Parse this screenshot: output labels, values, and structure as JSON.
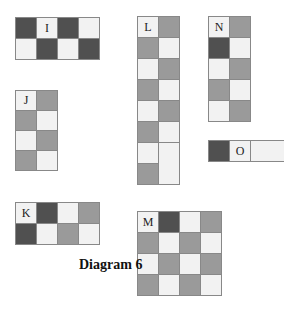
{
  "diagram": {
    "caption": "Diagram 6",
    "colors": {
      "white": "#f2f2f2",
      "gray": "#9a9a9a",
      "dark": "#505050"
    },
    "pieces": [
      {
        "id": "I",
        "label": "I",
        "rows": [
          [
            "w",
            "d",
            "w",
            "d"
          ],
          [
            "w",
            "d",
            "w",
            "d"
          ]
        ]
      },
      {
        "id": "J",
        "label": "J",
        "rows": [
          [
            "w",
            "g"
          ],
          [
            "g",
            "w"
          ],
          [
            "w",
            "g"
          ],
          [
            "g",
            "w"
          ]
        ]
      },
      {
        "id": "K",
        "label": "K",
        "rows": [
          [
            "w",
            "d",
            "w",
            "g"
          ],
          [
            "d",
            "w",
            "g",
            "w"
          ]
        ]
      },
      {
        "id": "L",
        "label": "L",
        "rows": [
          [
            "w",
            "g"
          ],
          [
            "g",
            "w"
          ],
          [
            "w",
            "g"
          ],
          [
            "g",
            "w"
          ],
          [
            "w",
            "g"
          ],
          [
            "g",
            "w"
          ],
          [
            "w",
            "w"
          ],
          [
            "g",
            "w"
          ]
        ]
      },
      {
        "id": "M",
        "label": "M",
        "rows": [
          [
            "w",
            "d",
            "w",
            "g"
          ],
          [
            "g",
            "w",
            "g",
            "w"
          ],
          [
            "w",
            "g",
            "w",
            "g"
          ],
          [
            "g",
            "w",
            "g",
            "w"
          ]
        ]
      },
      {
        "id": "N",
        "label": "N",
        "rows": [
          [
            "w",
            "g"
          ],
          [
            "d",
            "w"
          ],
          [
            "w",
            "g"
          ],
          [
            "g",
            "w"
          ],
          [
            "w",
            "g"
          ]
        ]
      },
      {
        "id": "O",
        "label": "O",
        "rows": [
          [
            "d",
            "w",
            "w"
          ]
        ]
      }
    ]
  }
}
